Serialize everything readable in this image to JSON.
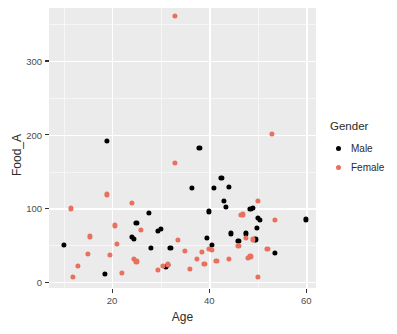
{
  "chart_data": {
    "type": "scatter",
    "title": "",
    "xlabel": "Age",
    "ylabel": "Food_A",
    "xlim": [
      7,
      62
    ],
    "ylim": [
      -8,
      372
    ],
    "x_ticks": [
      20,
      40,
      60
    ],
    "y_ticks": [
      0,
      100,
      200,
      300
    ],
    "x_tick_labels": [
      "20",
      "40",
      "60"
    ],
    "y_tick_labels": [
      "0",
      "100",
      "200",
      "300"
    ],
    "grid": true,
    "grid_minor": true,
    "legend": {
      "title": "Gender",
      "position": "right",
      "entries": [
        {
          "label": "Male",
          "color": "#000000",
          "key": "male-legend-dot"
        },
        {
          "label": "Female",
          "color": "#E8705F",
          "key": "female-legend-dot"
        }
      ]
    },
    "colors": {
      "male": "#000000",
      "female": "#E8705F",
      "panel_background": "#EBEBEB",
      "gridline": "#FFFFFF",
      "text": "#2b2b2b",
      "tick_text": "#4d4d4d",
      "plot_background": "#FFFFFF"
    },
    "series": [
      {
        "name": "Male",
        "color": "#000000",
        "points": [
          [
            10,
            50
          ],
          [
            18.5,
            11
          ],
          [
            19,
            192
          ],
          [
            24,
            61
          ],
          [
            24.5,
            59
          ],
          [
            25,
            80
          ],
          [
            27.5,
            94
          ],
          [
            28,
            46
          ],
          [
            29.5,
            70
          ],
          [
            30,
            72
          ],
          [
            31,
            21
          ],
          [
            31.5,
            23
          ],
          [
            32,
            46
          ],
          [
            36.5,
            128
          ],
          [
            38,
            182
          ],
          [
            39.5,
            60
          ],
          [
            40,
            96
          ],
          [
            40.5,
            50
          ],
          [
            41,
            128
          ],
          [
            42.5,
            141
          ],
          [
            43,
            110
          ],
          [
            43.5,
            102
          ],
          [
            44,
            129
          ],
          [
            44.5,
            66
          ],
          [
            46,
            56
          ],
          [
            47.5,
            66
          ],
          [
            48.5,
            99
          ],
          [
            49,
            101
          ],
          [
            49.5,
            58
          ],
          [
            49.8,
            74
          ],
          [
            50,
            87
          ],
          [
            50.5,
            84
          ],
          [
            53.5,
            40
          ],
          [
            60,
            85
          ]
        ]
      },
      {
        "name": "Female",
        "color": "#E8705F",
        "points": [
          [
            11.5,
            100
          ],
          [
            12,
            7
          ],
          [
            13,
            22
          ],
          [
            15,
            38
          ],
          [
            15.5,
            62
          ],
          [
            19,
            119
          ],
          [
            19.5,
            37
          ],
          [
            20.5,
            77
          ],
          [
            21,
            52
          ],
          [
            22,
            13
          ],
          [
            24,
            108
          ],
          [
            24.5,
            32
          ],
          [
            25,
            28
          ],
          [
            26,
            71
          ],
          [
            29.5,
            17
          ],
          [
            30.5,
            22
          ],
          [
            31.5,
            24
          ],
          [
            33,
            162
          ],
          [
            33,
            361
          ],
          [
            33.5,
            57
          ],
          [
            35,
            42
          ],
          [
            36,
            18
          ],
          [
            37.5,
            32
          ],
          [
            38.5,
            41
          ],
          [
            39,
            25
          ],
          [
            40,
            45
          ],
          [
            40.5,
            44
          ],
          [
            41.5,
            29
          ],
          [
            44,
            31
          ],
          [
            46,
            49
          ],
          [
            46.5,
            91
          ],
          [
            47,
            92
          ],
          [
            47.5,
            60
          ],
          [
            48,
            33
          ],
          [
            48.5,
            35
          ],
          [
            49,
            58
          ],
          [
            50,
            110
          ],
          [
            50,
            7
          ],
          [
            52,
            45
          ],
          [
            53,
            201
          ],
          [
            53.5,
            84
          ]
        ]
      }
    ]
  }
}
